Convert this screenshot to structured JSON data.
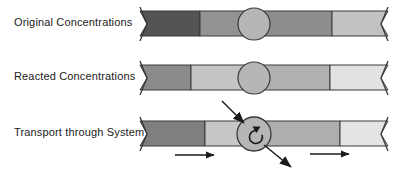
{
  "diagram": {
    "background_color": "#ffffff",
    "outline_color": "#3a3a3a",
    "arrow_color": "#1b1b1b"
  },
  "rows": [
    {
      "label": "Original Concentrations",
      "label_x": 14,
      "label_y": 23,
      "bar_top": 11,
      "bar_height": 25,
      "bar_left": 140,
      "bar_right": 388,
      "circle_cx": 254,
      "circle_cy": 24,
      "circle_r": 16,
      "circle_fill": "#b6b6b6",
      "segments": [
        {
          "name": "segment-1",
          "x0": 140,
          "x1": 200,
          "color": "#545454"
        },
        {
          "name": "segment-2",
          "x0": 200,
          "x1": 254,
          "color": "#939393"
        },
        {
          "name": "segment-3",
          "x0": 254,
          "x1": 332,
          "color": "#8d8d8d"
        },
        {
          "name": "segment-4",
          "x0": 332,
          "x1": 388,
          "color": "#c2c2c2"
        }
      ]
    },
    {
      "label": "Reacted Concentrations",
      "label_x": 14,
      "label_y": 77,
      "bar_top": 65,
      "bar_height": 25,
      "bar_left": 140,
      "bar_right": 388,
      "circle_cx": 254,
      "circle_cy": 78,
      "circle_r": 16,
      "circle_fill": "#b6b6b6",
      "segments": [
        {
          "name": "segment-1",
          "x0": 140,
          "x1": 191,
          "color": "#8b8b8b"
        },
        {
          "name": "segment-2",
          "x0": 191,
          "x1": 254,
          "color": "#c4c4c4"
        },
        {
          "name": "segment-3",
          "x0": 254,
          "x1": 330,
          "color": "#b0b0b0"
        },
        {
          "name": "segment-4",
          "x0": 330,
          "x1": 388,
          "color": "#e2e2e2"
        }
      ]
    },
    {
      "label": "Transport through System",
      "label_x": 14,
      "label_y": 134,
      "bar_top": 121,
      "bar_height": 25,
      "bar_left": 140,
      "bar_right": 388,
      "circle_cx": 254,
      "circle_cy": 134,
      "circle_r": 17,
      "circle_fill": "#b6b6b6",
      "segments": [
        {
          "name": "segment-1",
          "x0": 140,
          "x1": 205,
          "color": "#7f7f7f"
        },
        {
          "name": "segment-2",
          "x0": 205,
          "x1": 254,
          "color": "#c6c6c6"
        },
        {
          "name": "segment-3",
          "x0": 254,
          "x1": 340,
          "color": "#aeaeae"
        },
        {
          "name": "segment-4",
          "x0": 340,
          "x1": 388,
          "color": "#e4e4e4"
        }
      ]
    }
  ],
  "annotations": {
    "inflow_arrow": {
      "name": "inflow-arrow",
      "x1": 222,
      "y1": 101,
      "x2": 245,
      "y2": 124
    },
    "outflow_arrow": {
      "name": "outflow-arrow",
      "x1": 264,
      "y1": 144,
      "x2": 292,
      "y2": 168
    },
    "reaction_loop": {
      "name": "reaction-loop-icon"
    },
    "flow_arrows": [
      {
        "name": "flow-arrow-left",
        "x1": 175,
        "y1": 155,
        "x2": 216,
        "y2": 155
      },
      {
        "name": "flow-arrow-right",
        "x1": 310,
        "y1": 154,
        "x2": 351,
        "y2": 154
      }
    ]
  }
}
